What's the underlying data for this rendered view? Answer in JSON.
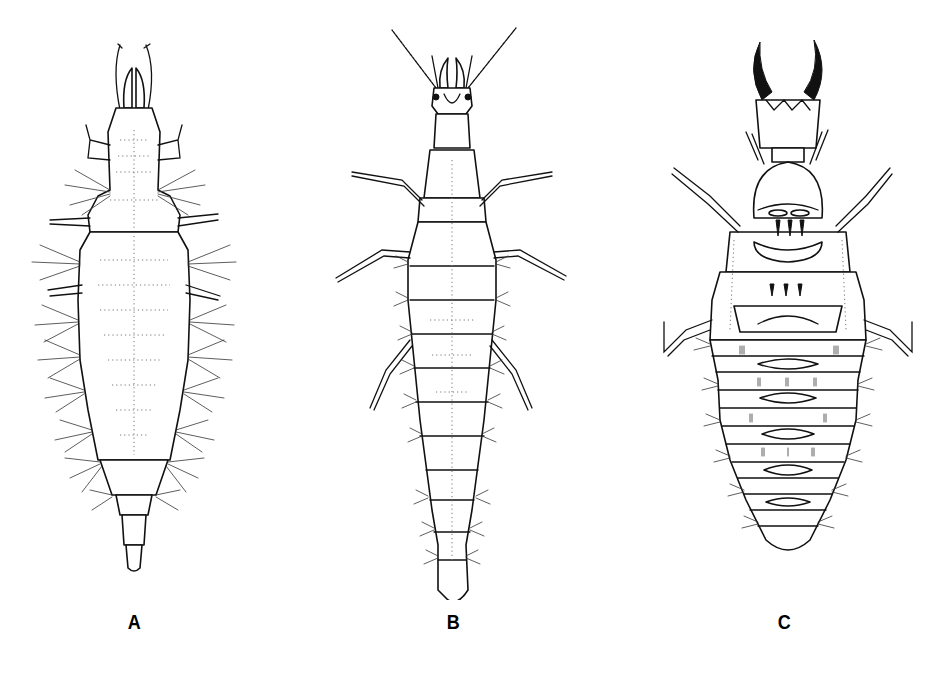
{
  "figure": {
    "type": "scientific-illustration",
    "panels": [
      {
        "id": "A",
        "label": "A",
        "description": "Elongate spindle-shaped larva with long lateral setae tufts, short legs and segmented tail"
      },
      {
        "id": "B",
        "label": "B",
        "description": "Slender elongate larva with long beaded antennae, long legs and tapering segmented abdomen"
      },
      {
        "id": "C",
        "label": "C",
        "description": "Broad larva with large dark sickle-shaped mandibles, bristly legs and many transverse abdominal segments"
      }
    ]
  },
  "colors": {
    "background": "#ffffff",
    "ink": "#111111",
    "stipple": "#777777"
  }
}
